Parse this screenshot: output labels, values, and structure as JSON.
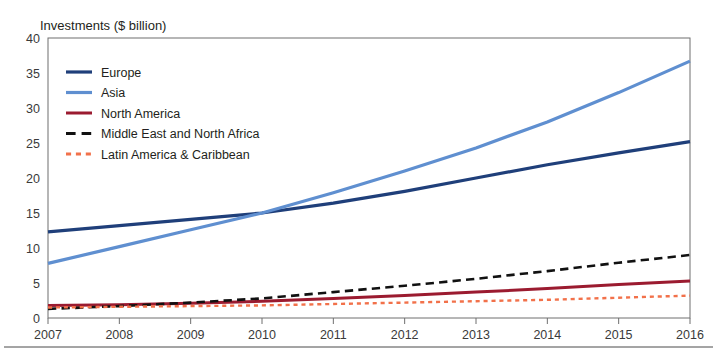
{
  "chart_data": {
    "type": "line",
    "title": "",
    "ylabel": "Investments ($ billion)",
    "xlabel": "",
    "x": [
      2007,
      2008,
      2009,
      2010,
      2011,
      2012,
      2013,
      2014,
      2015,
      2016
    ],
    "xticklabels": [
      "2007",
      "2008",
      "2009",
      "2010",
      "2011",
      "2012",
      "2013",
      "2014",
      "2015",
      "2016"
    ],
    "yticks": [
      0,
      5,
      10,
      15,
      20,
      25,
      30,
      35,
      40
    ],
    "yticklabels": [
      "0",
      "5",
      "10",
      "15",
      "20",
      "25",
      "30",
      "35",
      "40"
    ],
    "ylim": [
      0,
      40
    ],
    "xlim": [
      2007,
      2016
    ],
    "grid": false,
    "legend_position": "upper-left-inside",
    "series": [
      {
        "name": "Europe",
        "color": "#1f3f7a",
        "style": "solid",
        "width": 3.2,
        "values": [
          12.3,
          13.2,
          14.1,
          15.0,
          16.4,
          18.1,
          20.0,
          21.9,
          23.6,
          25.2
        ]
      },
      {
        "name": "Asia",
        "color": "#5f8fd0",
        "style": "solid",
        "width": 3.2,
        "values": [
          7.8,
          10.2,
          12.6,
          15.0,
          17.9,
          21.0,
          24.3,
          28.0,
          32.2,
          36.7
        ]
      },
      {
        "name": "North America",
        "color": "#9b1b30",
        "style": "solid",
        "width": 3.0,
        "values": [
          1.8,
          1.9,
          2.1,
          2.4,
          2.8,
          3.2,
          3.7,
          4.2,
          4.8,
          5.3
        ]
      },
      {
        "name": "Middle East and North Africa",
        "color": "#111111",
        "style": "dashed",
        "width": 2.6,
        "values": [
          1.3,
          1.7,
          2.2,
          2.8,
          3.7,
          4.6,
          5.6,
          6.7,
          7.9,
          9.0
        ]
      },
      {
        "name": "Latin America & Caribbean",
        "color": "#f2714a",
        "style": "dotted",
        "width": 2.4,
        "values": [
          1.5,
          1.6,
          1.7,
          1.8,
          2.0,
          2.2,
          2.4,
          2.6,
          2.9,
          3.2
        ]
      }
    ]
  }
}
